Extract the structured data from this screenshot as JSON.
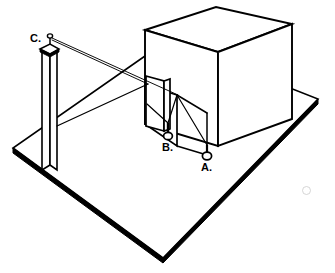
{
  "figure": {
    "kind": "technical-illustration",
    "background_color": "#ffffff",
    "ink_color": "#000000",
    "labels": [
      {
        "id": "label-c",
        "text": "C.",
        "x": 33,
        "y": 41,
        "marker": "post-top-hook"
      },
      {
        "id": "label-b",
        "text": "B.",
        "x": 164,
        "y": 147,
        "marker": "ring"
      },
      {
        "id": "label-a",
        "text": "A.",
        "x": 203,
        "y": 168,
        "marker": "ring"
      }
    ],
    "parts": {
      "base_platform": {
        "name": "base-platform",
        "shape": "rhombus",
        "vertices": [
          {
            "x": 13,
            "y": 148
          },
          {
            "x": 163,
            "y": 258
          },
          {
            "x": 318,
            "y": 99
          },
          {
            "x": 168,
            "y": 40
          }
        ],
        "edge_thickness_px": 4,
        "shaded_edges": "front-left and front-right"
      },
      "box": {
        "name": "box-enclosure",
        "shape": "cuboid",
        "top_face": [
          {
            "x": 145,
            "y": 30
          },
          {
            "x": 216,
            "y": 7
          },
          {
            "x": 292,
            "y": 24
          },
          {
            "x": 218,
            "y": 52
          }
        ],
        "front_left_face_depth_px": 94,
        "front_right_face_depth_px": 100,
        "hidden_inner_chamber": "dashed",
        "line_style_visible": "solid",
        "line_style_hidden": "dashed"
      },
      "post": {
        "name": "upright-post",
        "shape": "square-column",
        "top_y": 46,
        "bottom_y": 170,
        "left_x": 42,
        "width_px": 13,
        "cap": "small flanged cap with eyelet at top"
      },
      "flap_panel": {
        "name": "flap-panel",
        "shape": "thin-vertical-rectangle",
        "top_left": {
          "x": 146,
          "y": 76
        },
        "height_px": 50,
        "width_px": 18
      },
      "cords": {
        "name": "tension-cords",
        "count": 2,
        "from": "post top",
        "to": "box front edge and flap panel",
        "stroke_width_px": 0.9
      },
      "rings": [
        {
          "name": "ring-b",
          "cx": 168,
          "cy": 135,
          "rx": 4.4,
          "ry": 3.6,
          "stem_height_px": 12
        },
        {
          "name": "ring-a",
          "cx": 207,
          "cy": 155,
          "rx": 4.6,
          "ry": 3.8,
          "stem_height_px": 10
        }
      ],
      "artifact": {
        "name": "paper-smudge",
        "x": 302,
        "y": 186,
        "size_px": 7
      }
    }
  }
}
